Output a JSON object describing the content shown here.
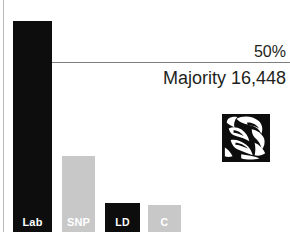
{
  "chart_data": {
    "type": "bar",
    "title": "",
    "xlabel": "",
    "ylabel": "",
    "categories": [
      "Lab",
      "SNP",
      "LD",
      "C"
    ],
    "values": [
      62.5,
      22.5,
      8.6,
      8.0
    ],
    "ylim": [
      0,
      70
    ],
    "grid": false,
    "legend": "none",
    "series": [
      {
        "name": "Vote share",
        "values": [
          62.5,
          22.5,
          8.6,
          8.0
        ],
        "colors": [
          "#0d0d0d",
          "#c8c8c8",
          "#0d0d0d",
          "#c8c8c8"
        ]
      }
    ],
    "annotations": [
      {
        "name": "threshold",
        "label": "50%",
        "value": 50
      },
      {
        "name": "majority",
        "label": "Majority 16,448"
      }
    ]
  },
  "bars": [
    {
      "label": "Lab",
      "style": "dark",
      "left": 13,
      "top": 21,
      "width": 39,
      "height": 211
    },
    {
      "label": "SNP",
      "style": "light",
      "left": 62,
      "top": 156,
      "width": 33,
      "height": 76
    },
    {
      "label": "LD",
      "style": "dark",
      "left": 105,
      "top": 203,
      "width": 35,
      "height": 29
    },
    {
      "label": "C",
      "style": "light",
      "left": 148,
      "top": 205,
      "width": 33,
      "height": 27
    }
  ],
  "annotations": {
    "threshold_label": "50%",
    "majority_label": "Majority 16,448"
  },
  "emblem": {
    "name": "labour-rose-emblem",
    "color": "#0d0d0d"
  },
  "colors": {
    "dark_bar": "#0d0d0d",
    "light_bar": "#c8c8c8",
    "text": "#231f20",
    "rule": "#7d7d7d",
    "axis": "#b9b9b9",
    "background": "#ffffff"
  }
}
